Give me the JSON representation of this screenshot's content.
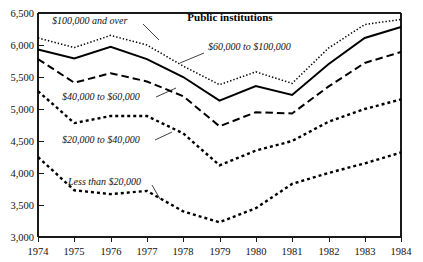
{
  "chart_data": {
    "type": "line",
    "title": "Public institutions",
    "xlabel": "",
    "ylabel": "",
    "x": [
      1974,
      1975,
      1976,
      1977,
      1978,
      1979,
      1980,
      1981,
      1982,
      1983,
      1984
    ],
    "xtick_labels": [
      "1974",
      "1975",
      "1976",
      "1977",
      "1978",
      "1979",
      "1980",
      "1981",
      "1982",
      "1983",
      "1984"
    ],
    "ytick_labels": [
      "3,000",
      "3,500",
      "4,000",
      "4,500",
      "5,000",
      "5,500",
      "6,000",
      "6,500"
    ],
    "yticks": [
      3000,
      3500,
      4000,
      4500,
      5000,
      5500,
      6000,
      6500
    ],
    "xlim": [
      1974,
      1984
    ],
    "ylim": [
      3000,
      6500
    ],
    "grid": false,
    "legend_position": "inline-annotations",
    "series": [
      {
        "name": "$100,000 and over",
        "line_style": "fine-dotted",
        "color": "#000000",
        "values": [
          6110,
          5960,
          6150,
          6000,
          5670,
          5380,
          5580,
          5400,
          5950,
          6320,
          6400
        ]
      },
      {
        "name": "$60,000 to $100,000",
        "line_style": "solid",
        "color": "#000000",
        "values": [
          5930,
          5790,
          5970,
          5780,
          5500,
          5130,
          5360,
          5220,
          5700,
          6110,
          6280
        ]
      },
      {
        "name": "$40,000 to $60,000",
        "line_style": "long-dashed",
        "color": "#000000",
        "values": [
          5780,
          5410,
          5560,
          5430,
          5200,
          4730,
          4950,
          4930,
          5350,
          5720,
          5890
        ]
      },
      {
        "name": "$20,000 to $40,000",
        "line_style": "square-dotted",
        "color": "#000000",
        "values": [
          5280,
          4780,
          4890,
          4890,
          4620,
          4120,
          4350,
          4500,
          4800,
          5000,
          5150
        ]
      },
      {
        "name": "Less than $20,000",
        "line_style": "square-dotted",
        "color": "#000000",
        "values": [
          4250,
          3730,
          3670,
          3720,
          3400,
          3230,
          3450,
          3830,
          4000,
          4150,
          4320
        ]
      }
    ],
    "annotations": [
      {
        "text": "$100,000 and over",
        "x": 52,
        "y": 24
      },
      {
        "text": "$60,000 to $100,000",
        "x": 205,
        "y": 50
      },
      {
        "text": "$40,000 to $60,000",
        "x": 62,
        "y": 100
      },
      {
        "text": "$20,000 to $40,000",
        "x": 62,
        "y": 143
      },
      {
        "text": "Less than $20,000",
        "x": 68,
        "y": 185
      }
    ]
  }
}
